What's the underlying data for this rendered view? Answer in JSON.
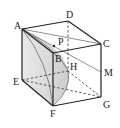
{
  "diagram": {
    "type": "cube-geometry",
    "labels": {
      "A": "A",
      "B": "B",
      "C": "C",
      "D": "D",
      "E": "E",
      "F": "F",
      "G": "G",
      "H": "H",
      "M": "M",
      "P": "P"
    },
    "colors": {
      "edge": "#222222",
      "shade": "#d9d9d9",
      "background": "#ffffff"
    }
  }
}
